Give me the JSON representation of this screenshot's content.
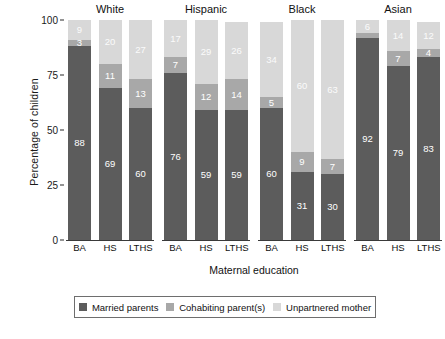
{
  "chart_data": {
    "type": "bar",
    "subtype": "stacked-percentage-grouped",
    "title": "",
    "xlabel": "Maternal education",
    "ylabel": "Percentage of children",
    "ylim": [
      0,
      100
    ],
    "yticks": [
      0,
      25,
      50,
      75,
      100
    ],
    "ytick_labels": [
      "0",
      "25",
      "50",
      "75",
      "100"
    ],
    "grid": false,
    "legend_position": "bottom",
    "panels": [
      "White",
      "Hispanic",
      "Black",
      "Asian"
    ],
    "categories": [
      "BA",
      "HS",
      "LTHS"
    ],
    "series": [
      {
        "name": "Married parents",
        "color": "#5c5c5c",
        "values": {
          "White": [
            88,
            69,
            60
          ],
          "Hispanic": [
            76,
            59,
            59
          ],
          "Black": [
            60,
            31,
            30
          ],
          "Asian": [
            92,
            79,
            83
          ]
        }
      },
      {
        "name": "Cohabiting parent(s)",
        "color": "#a8a8a8",
        "values": {
          "White": [
            3,
            11,
            13
          ],
          "Hispanic": [
            7,
            12,
            14
          ],
          "Black": [
            5,
            9,
            7
          ],
          "Asian": [
            2,
            7,
            4
          ]
        }
      },
      {
        "name": "Unpartnered mother",
        "color": "#d8d8d8",
        "values": {
          "White": [
            9,
            20,
            27
          ],
          "Hispanic": [
            17,
            29,
            26
          ],
          "Black": [
            34,
            60,
            63
          ],
          "Asian": [
            6,
            14,
            12
          ]
        }
      }
    ],
    "data_labels": {
      "White": {
        "BA": [
          "88",
          "3",
          "9"
        ],
        "HS": [
          "69",
          "11",
          "20"
        ],
        "LTHS": [
          "60",
          "13",
          "27"
        ]
      },
      "Hispanic": {
        "BA": [
          "76",
          "7",
          "17"
        ],
        "HS": [
          "59",
          "12",
          "29"
        ],
        "LTHS": [
          "59",
          "14",
          "26"
        ]
      },
      "Black": {
        "BA": [
          "60",
          "5",
          "34"
        ],
        "HS": [
          "31",
          "9",
          "60"
        ],
        "LTHS": [
          "30",
          "7",
          "63"
        ]
      },
      "Asian": {
        "BA": [
          "92",
          "",
          "6"
        ],
        "HS": [
          "79",
          "7",
          "14"
        ],
        "LTHS": [
          "83",
          "4",
          "12"
        ]
      }
    }
  },
  "axes": {
    "y_title": "Percentage of children",
    "x_title": "Maternal education",
    "y_ticks": [
      "100",
      "75",
      "50",
      "25",
      "0"
    ],
    "x_ticks": [
      "BA",
      "HS",
      "LTHS"
    ]
  },
  "panel_titles": {
    "p0": "White",
    "p1": "Hispanic",
    "p2": "Black",
    "p3": "Asian"
  },
  "legend": {
    "items": [
      {
        "label": "Married parents",
        "color": "#5c5c5c"
      },
      {
        "label": "Cohabiting parent(s)",
        "color": "#a8a8a8"
      },
      {
        "label": "Unpartnered mother",
        "color": "#d8d8d8"
      }
    ]
  }
}
